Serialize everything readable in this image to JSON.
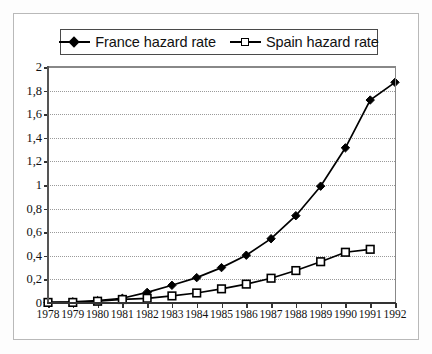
{
  "chart_data": {
    "type": "line",
    "title": "",
    "xlabel": "",
    "ylabel": "",
    "x": [
      1978,
      1979,
      1980,
      1981,
      1982,
      1983,
      1984,
      1985,
      1986,
      1987,
      1988,
      1989,
      1990,
      1991,
      1992
    ],
    "categories": [
      "1978",
      "1979",
      "1980",
      "1981",
      "1982",
      "1983",
      "1984",
      "1985",
      "1986",
      "1987",
      "1988",
      "1989",
      "1990",
      "1991",
      "1992"
    ],
    "series": [
      {
        "name": "France hazard rate",
        "marker": "filled-diamond",
        "color": "#000000",
        "values": [
          0.005,
          0.01,
          0.02,
          0.04,
          0.09,
          0.15,
          0.215,
          0.3,
          0.405,
          0.545,
          0.74,
          0.99,
          1.315,
          1.72,
          1.87
        ]
      },
      {
        "name": "Spain hazard rate",
        "marker": "open-square",
        "color": "#000000",
        "values": [
          0.005,
          0.005,
          0.015,
          0.03,
          0.04,
          0.06,
          0.085,
          0.12,
          0.16,
          0.21,
          0.275,
          0.35,
          0.43,
          0.455,
          null
        ]
      }
    ],
    "ylim": [
      0,
      2
    ],
    "yticks": [
      0,
      0.2,
      0.4,
      0.6,
      0.8,
      1,
      1.2,
      1.4,
      1.6,
      1.8,
      2
    ],
    "ytick_labels": [
      "0",
      "0,2",
      "0,4",
      "0,6",
      "0,8",
      "1",
      "1,2",
      "1,4",
      "1,6",
      "1,8",
      "2"
    ],
    "xlim": [
      1978,
      1992
    ],
    "grid": "horizontal-dotted",
    "legend_position": "top-center",
    "decimal_separator": ","
  },
  "legend": {
    "entries": [
      {
        "label": "France hazard rate",
        "marker": "filled-diamond"
      },
      {
        "label": "Spain hazard rate",
        "marker": "open-square"
      }
    ]
  }
}
